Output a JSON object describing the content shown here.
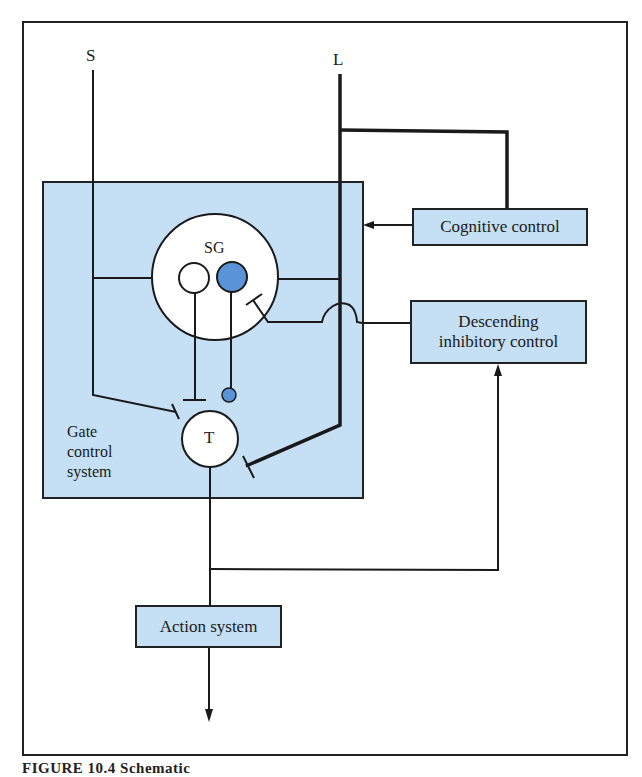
{
  "diagram": {
    "inputs": {
      "small_fiber_label": "S",
      "large_fiber_label": "L"
    },
    "gate_system": {
      "label_line1": "Gate",
      "label_line2": "control",
      "label_line3": "system"
    },
    "nodes": {
      "sg": "SG",
      "t": "T",
      "cognitive": "Cognitive control",
      "descending_line1": "Descending",
      "descending_line2": "inhibitory control",
      "action": "Action system"
    },
    "caption": "FIGURE 10.4 Schematic"
  },
  "colors": {
    "box_fill": "#c5dff4",
    "blue_neuron": "#5b93d8",
    "line": "#1a1a1a",
    "background": "#ffffff"
  }
}
